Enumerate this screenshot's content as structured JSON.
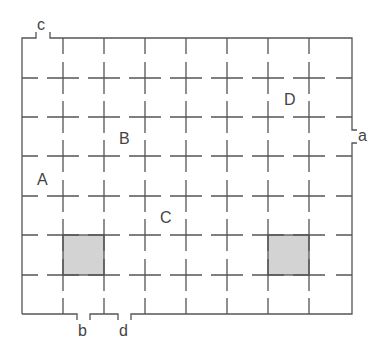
{
  "diagram": {
    "type": "floor-grid",
    "colors": {
      "line": "#555555",
      "shaded_cell": "#d3d3d3",
      "label": "#444444",
      "background": "#ffffff"
    },
    "room_labels": [
      {
        "id": "A",
        "text": "A",
        "x": 37,
        "y": 172
      },
      {
        "id": "B",
        "text": "B",
        "x": 119,
        "y": 131
      },
      {
        "id": "C",
        "text": "C",
        "x": 160,
        "y": 210
      },
      {
        "id": "D",
        "text": "D",
        "x": 284,
        "y": 92
      }
    ],
    "door_labels": [
      {
        "id": "a",
        "text": "a",
        "x": 358,
        "y": 128
      },
      {
        "id": "b",
        "text": "b",
        "x": 78,
        "y": 323
      },
      {
        "id": "c",
        "text": "c",
        "x": 37,
        "y": 17
      },
      {
        "id": "d",
        "text": "d",
        "x": 119,
        "y": 323
      }
    ],
    "shaded_cells": [
      {
        "col": 1,
        "row": 5
      },
      {
        "col": 6,
        "row": 5
      }
    ]
  }
}
